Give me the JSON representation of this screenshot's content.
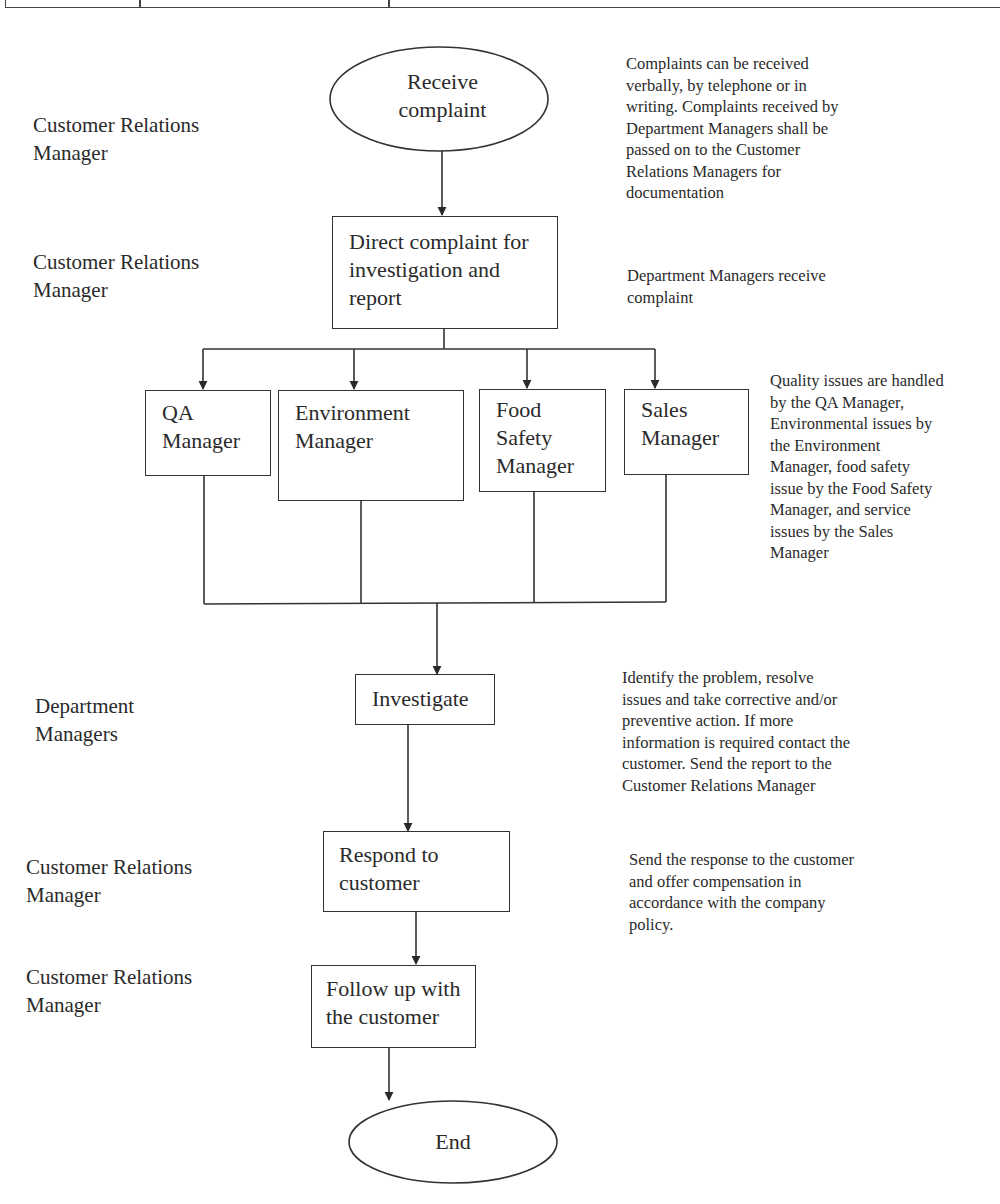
{
  "header_table": {
    "visible": "bottom edge of a table cut off at top"
  },
  "roles": [
    {
      "id": "role-1",
      "label": "Customer Relations\nManager"
    },
    {
      "id": "role-2",
      "label": "Customer Relations\nManager"
    },
    {
      "id": "role-3",
      "label": "Department\nManagers"
    },
    {
      "id": "role-4",
      "label": "Customer Relations\nManager"
    },
    {
      "id": "role-5",
      "label": "Customer Relations\nManager"
    }
  ],
  "steps": {
    "start": "Receive\ncomplaint",
    "direct": "Direct complaint for\ninvestigation and\nreport",
    "qa": "QA\nManager",
    "environment": "Environment\nManager",
    "food_safety": "Food\nSafety\nManager",
    "sales": "Sales\nManager",
    "investigate": "Investigate",
    "respond": "Respond to\ncustomer",
    "follow_up": "Follow up with\nthe customer",
    "end": "End"
  },
  "notes": {
    "receive": "Complaints can be received\nverbally, by telephone or in\nwriting. Complaints received by\nDepartment Managers shall be\npassed on to the Customer\nRelations Managers for\ndocumentation",
    "direct": "Department Managers receive\ncomplaint",
    "managers": "Quality issues are handled\nby the QA Manager,\nEnvironmental issues by\nthe Environment\nManager, food safety\nissue by the Food Safety\nManager, and service\nissues by the Sales\nManager",
    "investigate": "Identify the problem, resolve\nissues and take corrective and/or\npreventive action. If more\ninformation is required contact the\ncustomer. Send the report to the\nCustomer Relations Manager",
    "respond": "Send the response to the customer\nand offer compensation in\naccordance with the company\npolicy."
  },
  "colors": {
    "line": "#333333",
    "text": "#2a2a2a",
    "background": "#ffffff"
  }
}
